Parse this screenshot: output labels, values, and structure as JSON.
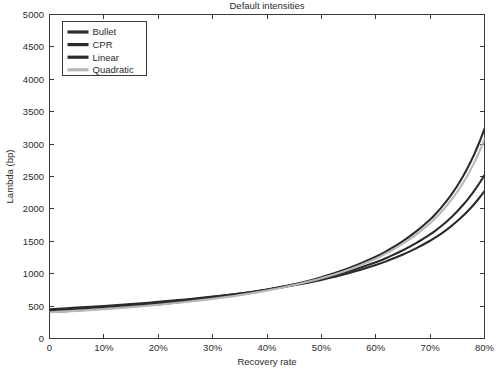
{
  "figure": {
    "title": "Default intensities",
    "background_color": "#ffffff",
    "axis_color": "#3a3a3a",
    "text_color": "#2b2b2b"
  },
  "chart_data": {
    "type": "line",
    "title": "Default intensities",
    "xlabel": "Recovery rate",
    "ylabel": "Lambda (bp)",
    "xlim": [
      0,
      80
    ],
    "ylim": [
      0,
      5000
    ],
    "grid": false,
    "legend_position": "upper-left",
    "x_tick_labels": [
      "0",
      "10%",
      "20%",
      "30%",
      "40%",
      "50%",
      "60%",
      "70%",
      "80%"
    ],
    "x_tick_values": [
      0,
      10,
      20,
      30,
      40,
      50,
      60,
      70,
      80
    ],
    "y_tick_labels": [
      "0",
      "500",
      "1000",
      "1500",
      "2000",
      "2500",
      "3000",
      "3500",
      "4000",
      "4500",
      "5000"
    ],
    "y_tick_values": [
      0,
      500,
      1000,
      1500,
      2000,
      2500,
      3000,
      3500,
      4000,
      4500,
      5000
    ],
    "x": [
      0,
      5,
      10,
      15,
      20,
      25,
      30,
      35,
      40,
      45,
      50,
      55,
      60,
      62.5,
      65,
      67.5,
      70,
      71,
      72,
      73,
      74,
      75,
      76,
      77,
      78,
      79,
      80
    ],
    "series": [
      {
        "name": "Bullet",
        "color": "#2b2b2b",
        "values": [
          452,
          476,
          502,
          532,
          565,
          603,
          646,
          695,
          753,
          822,
          905,
          1006,
          1133,
          1210,
          1296,
          1395,
          1508,
          1560,
          1616,
          1677,
          1742,
          1813,
          1890,
          1973,
          2064,
          2164,
          2273
        ]
      },
      {
        "name": "CPR",
        "color": "#2b2b2b",
        "values": [
          437,
          461,
          488,
          519,
          554,
          594,
          640,
          693,
          756,
          831,
          922,
          1034,
          1176,
          1263,
          1362,
          1475,
          1606,
          1666,
          1732,
          1803,
          1880,
          1964,
          2056,
          2156,
          2266,
          2388,
          2522
        ]
      },
      {
        "name": "Linear",
        "color": "#2b2b2b",
        "values": [
          409,
          432,
          459,
          491,
          527,
          570,
          620,
          679,
          751,
          838,
          946,
          1083,
          1261,
          1373,
          1503,
          1656,
          1837,
          1922,
          2016,
          2119,
          2232,
          2357,
          2496,
          2650,
          2823,
          3017,
          3236
        ]
      },
      {
        "name": "Quadratic",
        "color": "#b8b8b8",
        "values": [
          404,
          427,
          453,
          484,
          520,
          562,
          611,
          669,
          739,
          824,
          929,
          1061,
          1232,
          1339,
          1463,
          1608,
          1779,
          1859,
          1947,
          2043,
          2149,
          2265,
          2394,
          2536,
          2695,
          2873,
          3073
        ]
      }
    ]
  },
  "axes": {
    "x_label": "Recovery rate",
    "y_label": "Lambda (bp)",
    "x_ticks": [
      "0",
      "10%",
      "20%",
      "30%",
      "40%",
      "50%",
      "60%",
      "70%",
      "80%"
    ],
    "y_ticks": [
      "0",
      "500",
      "1000",
      "1500",
      "2000",
      "2500",
      "3000",
      "3500",
      "4000",
      "4500",
      "5000"
    ]
  },
  "legend": {
    "entries": [
      {
        "label": "Bullet",
        "color": "#2b2b2b"
      },
      {
        "label": "CPR",
        "color": "#2b2b2b"
      },
      {
        "label": "Linear",
        "color": "#2b2b2b"
      },
      {
        "label": "Quadratic",
        "color": "#b8b8b8"
      }
    ]
  }
}
